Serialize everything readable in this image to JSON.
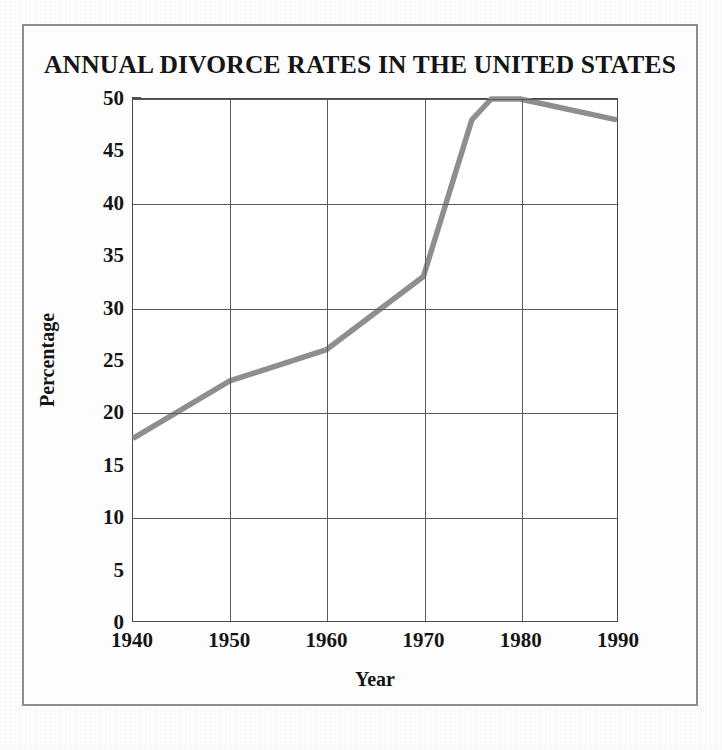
{
  "figure": {
    "title": "ANNUAL DIVORCE RATES IN THE UNITED STATES",
    "line_color": "#8e8e8e",
    "grid_color": "#5a5a5a",
    "frame_color": "#8e8e8e"
  },
  "chart_data": {
    "type": "line",
    "title": "ANNUAL DIVORCE RATES IN THE UNITED STATES",
    "xlabel": "Year",
    "ylabel": "Percentage",
    "xlim": [
      1940,
      1990
    ],
    "ylim": [
      0,
      50
    ],
    "grid": true,
    "legend": null,
    "x_ticks": [
      "1940",
      "1950",
      "1960",
      "1970",
      "1980",
      "1990"
    ],
    "x_tick_values": [
      1940,
      1950,
      1960,
      1970,
      1980,
      1990
    ],
    "y_ticks": [
      "0",
      "5",
      "10",
      "15",
      "20",
      "25",
      "30",
      "35",
      "40",
      "45",
      "50"
    ],
    "y_tick_values": [
      0,
      5,
      10,
      15,
      20,
      25,
      30,
      35,
      40,
      45,
      50
    ],
    "x_gridlines": [
      1950,
      1960,
      1970,
      1980
    ],
    "y_gridlines": [
      10,
      20,
      30,
      40,
      50
    ],
    "series": [
      {
        "name": "Divorce rate",
        "color": "#8e8e8e",
        "x": [
          1940,
          1950,
          1960,
          1970,
          1975,
          1977,
          1980,
          1990
        ],
        "values": [
          17.5,
          23,
          26,
          33,
          48,
          50,
          50,
          48
        ]
      }
    ]
  }
}
